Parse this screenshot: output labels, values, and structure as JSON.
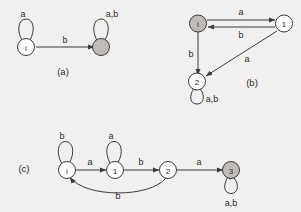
{
  "figure": {
    "background_color": "#f2f0ee",
    "stroke_color": "#3b3b3b",
    "accept_fill_color": "#bfbcb8",
    "normal_fill_color": "#ffffff",
    "width": 301,
    "height": 212
  },
  "diagrams": [
    {
      "id": "a",
      "caption": "(a)",
      "states": [
        {
          "name": "state-i",
          "label": "i",
          "kind": "initial"
        },
        {
          "name": "state-accept",
          "label": "",
          "kind": "accepting"
        }
      ],
      "transitions": [
        {
          "from": "i",
          "to": "i",
          "label": "a",
          "shape": "self-loop"
        },
        {
          "from": "i",
          "to": "accept",
          "label": "b",
          "shape": "straight"
        },
        {
          "from": "accept",
          "to": "accept",
          "label": "a,b",
          "shape": "self-loop"
        }
      ]
    },
    {
      "id": "b",
      "caption": "(b)",
      "states": [
        {
          "name": "state-i",
          "label": "i",
          "kind": "initial-accepting"
        },
        {
          "name": "state-1",
          "label": "1",
          "kind": "normal"
        },
        {
          "name": "state-2",
          "label": "2",
          "kind": "normal"
        }
      ],
      "transitions": [
        {
          "from": "i",
          "to": "1",
          "label": "a",
          "shape": "straight"
        },
        {
          "from": "1",
          "to": "i",
          "label": "b",
          "shape": "straight"
        },
        {
          "from": "i",
          "to": "2",
          "label": "b",
          "shape": "straight"
        },
        {
          "from": "1",
          "to": "2",
          "label": "a",
          "shape": "diagonal"
        },
        {
          "from": "2",
          "to": "2",
          "label": "a,b",
          "shape": "self-loop"
        }
      ]
    },
    {
      "id": "c",
      "caption": "(c)",
      "states": [
        {
          "name": "state-i",
          "label": "i",
          "kind": "initial"
        },
        {
          "name": "state-1",
          "label": "1",
          "kind": "normal"
        },
        {
          "name": "state-2",
          "label": "2",
          "kind": "normal"
        },
        {
          "name": "state-3",
          "label": "3",
          "kind": "accepting"
        }
      ],
      "transitions": [
        {
          "from": "i",
          "to": "i",
          "label": "b",
          "shape": "self-loop"
        },
        {
          "from": "i",
          "to": "1",
          "label": "a",
          "shape": "straight"
        },
        {
          "from": "1",
          "to": "1",
          "label": "a",
          "shape": "self-loop"
        },
        {
          "from": "1",
          "to": "2",
          "label": "b",
          "shape": "straight"
        },
        {
          "from": "2",
          "to": "3",
          "label": "a",
          "shape": "straight"
        },
        {
          "from": "2",
          "to": "i",
          "label": "b",
          "shape": "curved"
        },
        {
          "from": "3",
          "to": "3",
          "label": "a,b",
          "shape": "self-loop"
        }
      ]
    }
  ],
  "labels": {
    "a_loop_i": "a",
    "a_edge_b": "b",
    "a_loop_accept": "a,b",
    "a_caption": "(a)",
    "b_edge_top": "a",
    "b_edge_back": "b",
    "b_edge_down": "b",
    "b_edge_diag": "a",
    "b_loop_2": "a,b",
    "b_caption": "(b)",
    "b_state_i": "i",
    "b_state_1": "1",
    "b_state_2": "2",
    "c_caption": "(c)",
    "c_loop_i": "b",
    "c_edge_i1": "a",
    "c_loop_1": "a",
    "c_edge_12": "b",
    "c_edge_23": "a",
    "c_edge_back": "b",
    "c_loop_3": "a,b",
    "c_state_i": "i",
    "c_state_1": "1",
    "c_state_2": "2",
    "c_state_3": "3",
    "a_state_i": "i"
  }
}
